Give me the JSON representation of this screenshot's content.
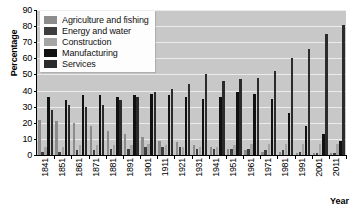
{
  "chart_data": {
    "type": "bar",
    "title": "",
    "xlabel": "Year",
    "ylabel": "Percentage",
    "ylim": [
      0,
      90
    ],
    "ytick_step": 10,
    "yticks": [
      0,
      10,
      20,
      30,
      40,
      50,
      60,
      70,
      80,
      90
    ],
    "grid": true,
    "legend_position": "top-left",
    "categories": [
      "1841",
      "1851",
      "1861",
      "1871",
      "1881",
      "1891",
      "1901",
      "1911",
      "1921",
      "1931",
      "1941",
      "1951",
      "1961",
      "1971",
      "1981",
      "1991",
      "2001",
      "2011"
    ],
    "series": [
      {
        "name": "Agriculture and fishing",
        "color": "#8c8c8c",
        "values": [
          22,
          21,
          20,
          18,
          15,
          13,
          11,
          9,
          8,
          6,
          5,
          4,
          3,
          2,
          2,
          1.5,
          1,
          1
        ]
      },
      {
        "name": "Energy and water",
        "color": "#3d3d3d",
        "values": [
          2,
          2,
          3,
          3,
          4,
          4,
          5,
          5,
          5,
          4,
          4,
          4,
          4,
          3,
          3,
          2,
          1.5,
          1.5
        ]
      },
      {
        "name": "Construction",
        "color": "#a5a5a5",
        "values": [
          5,
          5,
          6,
          6,
          6,
          6,
          7,
          6,
          5,
          5,
          5,
          6,
          7,
          7,
          7,
          7,
          7,
          7
        ]
      },
      {
        "name": "Manufacturing",
        "color": "#111111",
        "values": [
          36,
          34,
          37,
          37,
          36,
          37,
          38,
          37,
          36,
          35,
          36,
          39,
          38,
          35,
          26,
          18,
          13,
          9
        ]
      },
      {
        "name": "Services",
        "color": "#2b2b2b",
        "values": [
          28,
          31,
          30,
          31,
          34,
          36,
          39,
          41,
          44,
          50,
          46,
          47,
          48,
          52,
          60,
          66,
          75,
          81
        ]
      }
    ]
  },
  "axis": {
    "y_title": "Percentage",
    "x_title": "Year"
  }
}
